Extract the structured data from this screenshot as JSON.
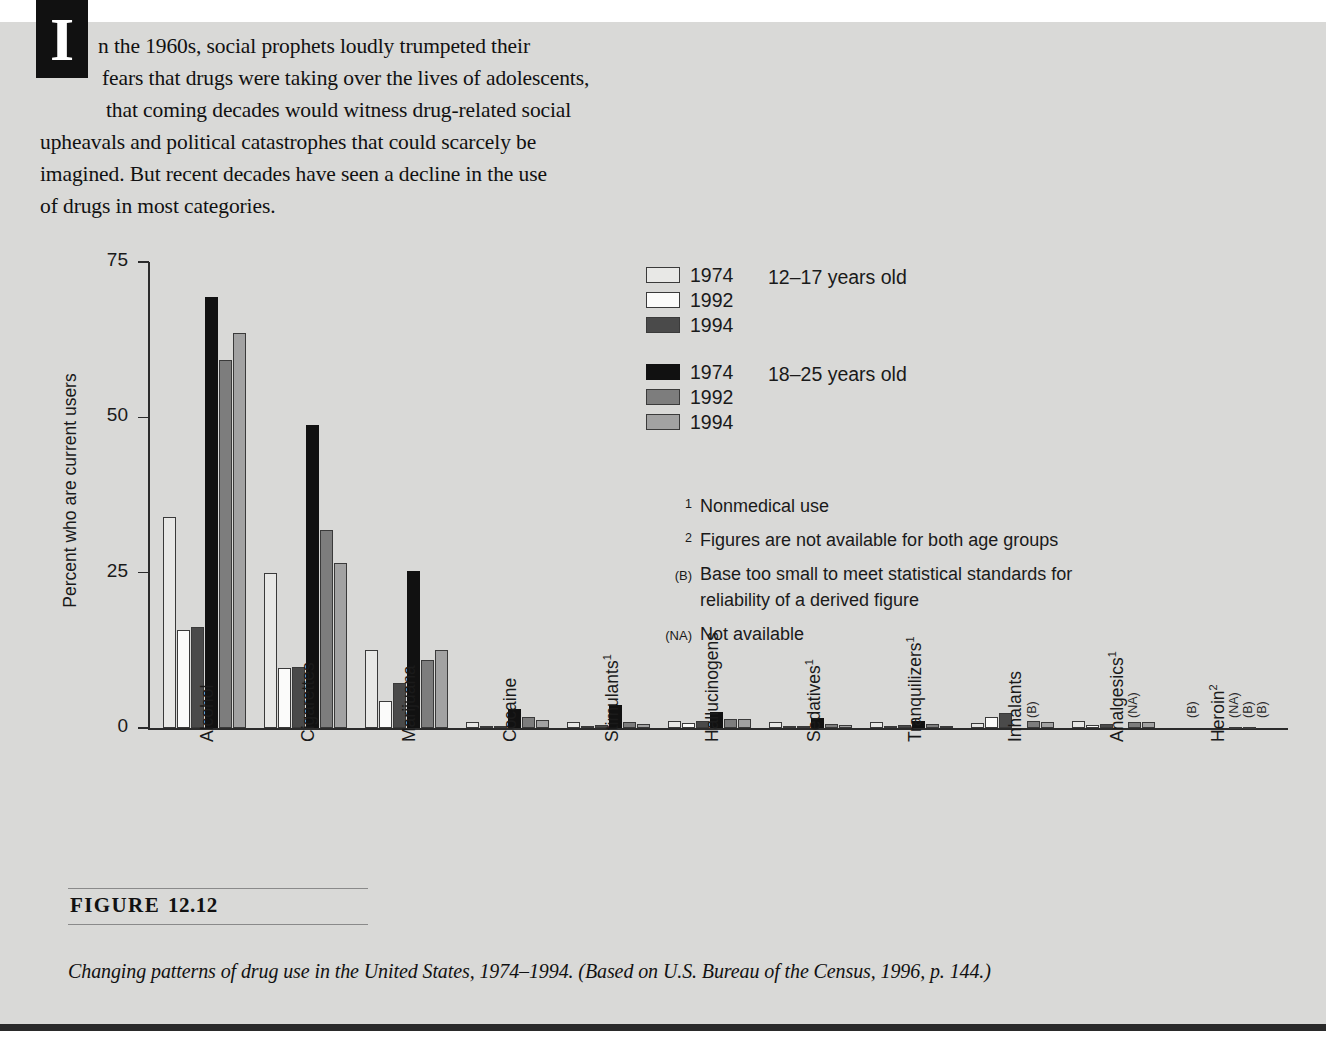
{
  "intro": {
    "lines": [
      "n the 1960s, social prophets loudly trumpeted their",
      "fears that drugs were taking over the lives of adolescents,",
      "that coming decades would witness drug-related social",
      "upheavals and political catastrophes that could scarcely be",
      "imagined. But recent decades have seen a decline in the use",
      "of drugs in most categories."
    ],
    "dropcap": "I"
  },
  "figure": {
    "label": "FIGURE",
    "number": "12.12",
    "caption": "Changing patterns of drug use in the United States, 1974–1994. (Based on U.S. Bureau of the Census, 1996, p. 144.)"
  },
  "legend": {
    "groups": [
      {
        "age_label": "12–17 years old",
        "entries": [
          {
            "year": "1974",
            "color": "#e8e8e6",
            "series_key": "1974_12_17"
          },
          {
            "year": "1992",
            "color": "#fbfbfa",
            "series_key": "1992_12_17"
          },
          {
            "year": "1994",
            "color": "#4a4a4a",
            "series_key": "1994_12_17"
          }
        ]
      },
      {
        "age_label": "18–25 years old",
        "entries": [
          {
            "year": "1974",
            "color": "#111111",
            "series_key": "1974_18_25"
          },
          {
            "year": "1992",
            "color": "#7d7d7d",
            "series_key": "1992_18_25"
          },
          {
            "year": "1994",
            "color": "#a2a2a2",
            "series_key": "1994_18_25"
          }
        ]
      }
    ]
  },
  "footnotes": [
    {
      "mark": "1",
      "mark_style": "sup",
      "text": "Nonmedical use"
    },
    {
      "mark": "2",
      "mark_style": "sup",
      "text": "Figures are not available for both age groups"
    },
    {
      "mark": "(B)",
      "mark_style": "paren",
      "text": "Base too small to meet statistical standards for reliability of a derived figure"
    },
    {
      "mark": "(NA)",
      "mark_style": "paren",
      "text": "Not available"
    }
  ],
  "chart_data": {
    "type": "bar",
    "title": "",
    "xlabel": "",
    "ylabel": "Percent who are current users",
    "ylim": [
      0,
      75
    ],
    "yticks": [
      0,
      25,
      50,
      75
    ],
    "ytick_labels": [
      "0",
      "25",
      "50",
      "75"
    ],
    "grid": false,
    "legend_position": "upper-right",
    "categories": [
      "Alcohol",
      "Cigarettes",
      "Marijuana",
      "Cocaine",
      "Stimulants",
      "Hallucinogens",
      "Sedatives",
      "Tranquilizers",
      "Inhalants",
      "Analgesics",
      "Heroin"
    ],
    "category_footnote_marks": [
      "",
      "",
      "",
      "",
      "1",
      "",
      "1",
      "1",
      "",
      "1",
      "2"
    ],
    "series": [
      {
        "name": "1974",
        "age_group": "12–17 years old",
        "color": "#e8e8e6",
        "values": [
          34.0,
          25.0,
          12.5,
          1.0,
          1.0,
          1.2,
          1.0,
          1.0,
          0.8,
          1.2,
          0.0
        ],
        "notes": [
          "",
          "",
          "",
          "",
          "",
          "",
          "",
          "",
          "",
          "",
          "(B)"
        ]
      },
      {
        "name": "1992",
        "age_group": "12–17 years old",
        "color": "#fbfbfa",
        "values": [
          15.7,
          9.6,
          4.3,
          0.3,
          0.3,
          0.8,
          0.3,
          0.4,
          1.8,
          0.5,
          0.0
        ],
        "notes": [
          "",
          "",
          "",
          "",
          "",
          "",
          "",
          "",
          "",
          "",
          ""
        ]
      },
      {
        "name": "1994",
        "age_group": "12–17 years old",
        "color": "#4a4a4a",
        "values": [
          16.2,
          9.8,
          7.3,
          0.4,
          0.5,
          1.1,
          0.3,
          0.5,
          2.4,
          0.6,
          0.0
        ],
        "notes": [
          "",
          "",
          "",
          "",
          "",
          "",
          "",
          "",
          "",
          "",
          ""
        ]
      },
      {
        "name": "1974",
        "age_group": "18–25 years old",
        "color": "#111111",
        "values": [
          69.3,
          48.8,
          25.2,
          3.1,
          3.7,
          2.5,
          1.6,
          1.2,
          0.0,
          0.0,
          0.0
        ],
        "notes": [
          "",
          "",
          "",
          "",
          "",
          "",
          "",
          "",
          "(B)",
          "(NA)",
          "(NA)"
        ]
      },
      {
        "name": "1992",
        "age_group": "18–25 years old",
        "color": "#7d7d7d",
        "values": [
          59.2,
          31.9,
          11.0,
          1.8,
          1.0,
          1.5,
          0.7,
          0.6,
          1.2,
          1.0,
          0.1
        ],
        "notes": [
          "",
          "",
          "",
          "",
          "",
          "",
          "",
          "",
          "",
          "",
          "(B)"
        ]
      },
      {
        "name": "1994",
        "age_group": "18–25 years old",
        "color": "#a2a2a2",
        "values": [
          63.5,
          26.5,
          12.6,
          1.3,
          0.7,
          1.5,
          0.5,
          0.4,
          1.0,
          0.9,
          0.1
        ],
        "notes": [
          "",
          "",
          "",
          "",
          "",
          "",
          "",
          "",
          "",
          "",
          "(B)"
        ]
      }
    ]
  }
}
